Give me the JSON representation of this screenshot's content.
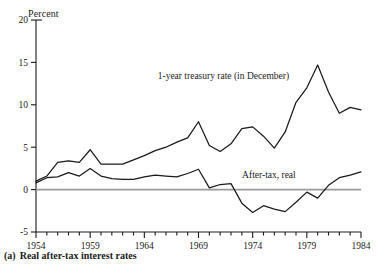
{
  "figure": {
    "caption_number": "(a)",
    "caption_text": "Real after-tax interest rates",
    "y_axis_title": "Percent"
  },
  "chart_data": {
    "type": "line",
    "title": "",
    "xlabel": "",
    "ylabel": "Percent",
    "xlim": [
      1954,
      1984
    ],
    "ylim": [
      -5,
      20
    ],
    "yticks": [
      -5,
      0,
      5,
      10,
      15,
      20
    ],
    "ytick_labels": [
      "-5",
      "0",
      "5",
      "10",
      "15",
      "20"
    ],
    "xticks": [
      1954,
      1959,
      1964,
      1969,
      1974,
      1979,
      1984
    ],
    "xtick_labels": [
      "1954",
      "1959",
      "1964",
      "1969",
      "1974",
      "1979",
      "1984"
    ],
    "minor_xticks_every": 1,
    "grid": false,
    "zero_line": true,
    "zero_line_color": "#9a9a9a",
    "line_color": "#1a1a1a",
    "legend_position": "inline-annotations",
    "x": [
      1954,
      1955,
      1956,
      1957,
      1958,
      1959,
      1960,
      1961,
      1962,
      1963,
      1964,
      1965,
      1966,
      1967,
      1968,
      1969,
      1970,
      1971,
      1972,
      1973,
      1974,
      1975,
      1976,
      1977,
      1978,
      1979,
      1980,
      1981,
      1982,
      1983,
      1984
    ],
    "series": [
      {
        "name": "1-year treasury rate (in December)",
        "label": "1-year treasury rate (in December)",
        "values": [
          1.0,
          1.6,
          3.2,
          3.4,
          3.2,
          4.7,
          3.0,
          3.0,
          3.0,
          3.5,
          4.0,
          4.6,
          5.0,
          5.6,
          6.1,
          8.0,
          5.2,
          4.5,
          5.4,
          7.2,
          7.4,
          6.3,
          4.9,
          6.8,
          10.3,
          12.0,
          14.7,
          11.5,
          9.0,
          9.7,
          9.4
        ]
      },
      {
        "name": "After-tax, real",
        "label": "After-tax, real",
        "values": [
          0.8,
          1.4,
          1.5,
          2.0,
          1.6,
          2.5,
          1.6,
          1.3,
          1.2,
          1.2,
          1.5,
          1.7,
          1.6,
          1.5,
          1.9,
          2.4,
          0.2,
          0.6,
          0.7,
          -1.6,
          -2.7,
          -1.9,
          -2.3,
          -2.6,
          -1.5,
          -0.3,
          -1.0,
          0.5,
          1.4,
          1.7,
          2.1
        ]
      }
    ],
    "annotations": [
      {
        "text": "1-year treasury rate (in December)",
        "x": 1971.3,
        "y": 13.0
      },
      {
        "text": "After-tax, real",
        "x": 1975.5,
        "y": 1.4
      }
    ]
  }
}
